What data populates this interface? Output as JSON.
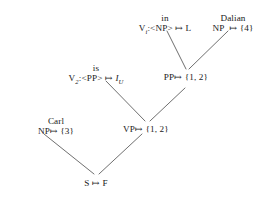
{
  "diagram": {
    "type": "derivation-tree",
    "title": "",
    "nodes": [
      {
        "id": "v-np",
        "word": "in",
        "label_pre": "V",
        "label_sub": "i",
        "label_post": ":<NP>",
        "map_arrow": "↦",
        "value": "L",
        "label_full": "V:<NP> ↦ L",
        "x": 165,
        "y": 13
      },
      {
        "id": "np-dalian",
        "word": "Dalian",
        "label_pre": "NP",
        "label_sub": "",
        "label_post": "",
        "map_arrow": "↦",
        "value": "{4}",
        "label_full": "NP ↦ {4}",
        "x": 233,
        "y": 13
      },
      {
        "id": "v-pp",
        "word": "is",
        "label_pre": "V",
        "label_sub": "2",
        "label_post": ":<PP>",
        "map_arrow": "↦",
        "value": "I",
        "value_sub": "U",
        "label_full": "V:<PP> ↦ I_U",
        "x": 96,
        "y": 63
      },
      {
        "id": "pp",
        "word": "",
        "label_pre": "PP",
        "label_sub": "",
        "label_post": "",
        "map_arrow": "↦",
        "value": "{1, 2}",
        "label_full": "PP ↦ {1, 2}",
        "x": 186,
        "y": 72
      },
      {
        "id": "np-carl",
        "word": "Carl",
        "label_pre": "NP",
        "label_sub": "",
        "label_post": "",
        "map_arrow": "↦",
        "value": "{3}",
        "label_full": "NP ↦ {3}",
        "x": 56,
        "y": 116
      },
      {
        "id": "vp",
        "word": "",
        "label_pre": "VP",
        "label_sub": "",
        "label_post": "",
        "map_arrow": "↦",
        "value": "{1, 2}",
        "label_full": "VP ↦ {1, 2}",
        "x": 146,
        "y": 124
      },
      {
        "id": "s",
        "word": "",
        "label_pre": "S",
        "label_sub": "",
        "label_post": "",
        "map_arrow": "↦",
        "value": "F",
        "label_full": "S ↦ F",
        "x": 96,
        "y": 178
      }
    ],
    "edges": [
      {
        "id": "e-vnp-pp",
        "from": "v-np",
        "to": "pp",
        "x1": 167,
        "y1": 31,
        "x2": 186,
        "y2": 69
      },
      {
        "id": "e-dalian-pp",
        "from": "np-dalian",
        "to": "pp",
        "x1": 228,
        "y1": 31,
        "x2": 189,
        "y2": 69
      },
      {
        "id": "e-vpp-vp",
        "from": "v-pp",
        "to": "vp",
        "x1": 106,
        "y1": 81,
        "x2": 145,
        "y2": 121
      },
      {
        "id": "e-pp-vp",
        "from": "pp",
        "to": "vp",
        "x1": 185,
        "y1": 88,
        "x2": 150,
        "y2": 121
      },
      {
        "id": "e-carl-s",
        "from": "np-carl",
        "to": "s",
        "x1": 44,
        "y1": 134,
        "x2": 94,
        "y2": 174
      },
      {
        "id": "e-vp-s",
        "from": "vp",
        "to": "s",
        "x1": 142,
        "y1": 134,
        "x2": 99,
        "y2": 174
      }
    ],
    "style": {
      "line_color": "#555555",
      "text_color": "#1a1a1a",
      "background": "#ffffff"
    }
  }
}
